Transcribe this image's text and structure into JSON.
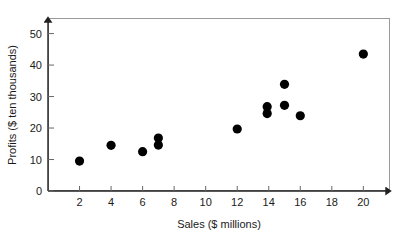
{
  "chart_data": {
    "type": "scatter",
    "title": "",
    "xlabel": "Sales ($ millions)",
    "ylabel": "Profits ($ ten thousands)",
    "xlim": [
      0,
      21.5
    ],
    "ylim": [
      0,
      54
    ],
    "xticks": [
      2,
      4,
      6,
      8,
      10,
      12,
      14,
      16,
      18,
      20
    ],
    "yticks": [
      0,
      10,
      20,
      30,
      40,
      50
    ],
    "xtick_labels": [
      "2",
      "4",
      "6",
      "8",
      "10",
      "12",
      "14",
      "16",
      "18",
      "20"
    ],
    "ytick_labels": [
      "0",
      "10",
      "20",
      "30",
      "40",
      "50"
    ],
    "grid": false,
    "legend": null,
    "marker": "filled-circle",
    "marker_color": "#000000",
    "marker_size": 4.6,
    "points": [
      {
        "x": 2.0,
        "y": 9.5
      },
      {
        "x": 4.0,
        "y": 14.5
      },
      {
        "x": 6.0,
        "y": 12.5
      },
      {
        "x": 7.0,
        "y": 16.8
      },
      {
        "x": 7.0,
        "y": 14.6
      },
      {
        "x": 12.0,
        "y": 19.7
      },
      {
        "x": 13.9,
        "y": 26.8
      },
      {
        "x": 13.9,
        "y": 24.6
      },
      {
        "x": 15.0,
        "y": 33.9
      },
      {
        "x": 15.0,
        "y": 27.2
      },
      {
        "x": 16.0,
        "y": 23.9
      },
      {
        "x": 20.0,
        "y": 43.5
      }
    ],
    "n_points": 12
  },
  "axes": {
    "x_axis_name": "sales-axis",
    "y_axis_name": "profits-axis",
    "arrowheads": true,
    "border_color": "#9a9a9a"
  },
  "colors": {
    "marker": "#000000",
    "axis": "#222222",
    "text": "#1a1a1a",
    "border": "#9a9a9a",
    "background": "#ffffff"
  }
}
